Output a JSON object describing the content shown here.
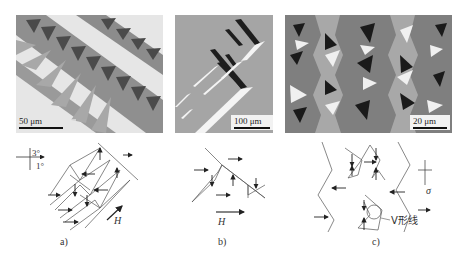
{
  "figure": {
    "panels": [
      {
        "id": "a",
        "scale_label": "50 μm",
        "caption": "a)"
      },
      {
        "id": "b",
        "scale_label": "100 μm",
        "caption": "b)"
      },
      {
        "id": "c",
        "scale_label": "20 μm",
        "caption": "c)"
      }
    ],
    "sketch_a": {
      "axis_top": "3°",
      "axis_right": "1°",
      "field_label": "H"
    },
    "sketch_b": {
      "field_label": "H"
    },
    "sketch_c": {
      "stress_label": "σ",
      "v_line_label": "V形线"
    }
  }
}
